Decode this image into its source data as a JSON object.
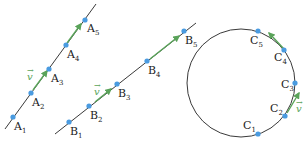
{
  "diagram": {
    "colors": {
      "line": "#222222",
      "point": "#4a9be0",
      "vector": "#5aa35a"
    },
    "vector_label": "v",
    "panel_a": {
      "points": [
        {
          "name": "A",
          "sub": "1"
        },
        {
          "name": "A",
          "sub": "2"
        },
        {
          "name": "A",
          "sub": "3"
        },
        {
          "name": "A",
          "sub": "4"
        },
        {
          "name": "A",
          "sub": "5"
        }
      ]
    },
    "panel_b": {
      "points": [
        {
          "name": "B",
          "sub": "1"
        },
        {
          "name": "B",
          "sub": "2"
        },
        {
          "name": "B",
          "sub": "3"
        },
        {
          "name": "B",
          "sub": "4"
        },
        {
          "name": "B",
          "sub": "5"
        }
      ]
    },
    "panel_c": {
      "points": [
        {
          "name": "C",
          "sub": "1"
        },
        {
          "name": "C",
          "sub": "2"
        },
        {
          "name": "C",
          "sub": "3"
        },
        {
          "name": "C",
          "sub": "4"
        },
        {
          "name": "C",
          "sub": "5"
        }
      ]
    }
  }
}
